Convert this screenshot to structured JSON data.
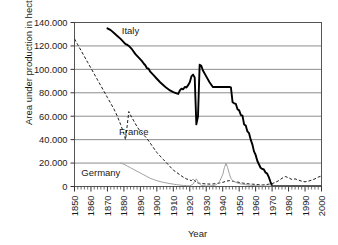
{
  "chart_data": {
    "type": "line",
    "title": "",
    "xlabel": "Year",
    "ylabel": "Area under production in hectares",
    "xlim": [
      1850,
      2000
    ],
    "ylim": [
      0,
      140000
    ],
    "grid": true,
    "legend": "inline-annotations",
    "ytick_labels": [
      "140.000",
      "120.000",
      "100.000",
      "80.000",
      "60.000",
      "40.000",
      "20.000",
      "0"
    ],
    "ytick_values": [
      140000,
      120000,
      100000,
      80000,
      60000,
      40000,
      20000,
      0
    ],
    "xtick_labels": [
      "1850",
      "1860",
      "1870",
      "1880",
      "1890",
      "1900",
      "1910",
      "1920",
      "1930",
      "1940",
      "1950",
      "1960",
      "1970",
      "1980",
      "1990",
      "2000"
    ],
    "xtick_values": [
      1850,
      1860,
      1870,
      1880,
      1890,
      1900,
      1910,
      1920,
      1930,
      1940,
      1950,
      1960,
      1970,
      1980,
      1990,
      2000
    ],
    "series": [
      {
        "name": "Italy",
        "style": "solid-thick-black",
        "color": "#000000",
        "label_position": {
          "x": 1884,
          "y": 133000
        },
        "points": [
          [
            1870,
            135000
          ],
          [
            1872,
            133500
          ],
          [
            1874,
            131000
          ],
          [
            1876,
            128500
          ],
          [
            1878,
            126000
          ],
          [
            1880,
            123000
          ],
          [
            1881,
            121500
          ],
          [
            1882,
            121000
          ],
          [
            1883,
            120000
          ],
          [
            1885,
            117000
          ],
          [
            1887,
            113000
          ],
          [
            1889,
            110000
          ],
          [
            1891,
            107000
          ],
          [
            1892,
            105000
          ],
          [
            1893,
            103500
          ],
          [
            1894,
            101000
          ],
          [
            1895,
            100500
          ],
          [
            1896,
            98000
          ],
          [
            1898,
            95000
          ],
          [
            1900,
            92000
          ],
          [
            1902,
            89000
          ],
          [
            1904,
            86500
          ],
          [
            1906,
            84000
          ],
          [
            1908,
            82000
          ],
          [
            1910,
            80500
          ],
          [
            1912,
            79500
          ],
          [
            1913,
            79000
          ],
          [
            1914,
            82000
          ],
          [
            1915,
            83500
          ],
          [
            1916,
            83000
          ],
          [
            1917,
            85000
          ],
          [
            1918,
            84500
          ],
          [
            1919,
            86500
          ],
          [
            1920,
            89000
          ],
          [
            1921,
            94000
          ],
          [
            1922,
            95500
          ],
          [
            1923,
            93000
          ],
          [
            1924,
            53000
          ],
          [
            1925,
            60000
          ],
          [
            1926,
            104000
          ],
          [
            1927,
            103000
          ],
          [
            1928,
            99000
          ],
          [
            1930,
            94000
          ],
          [
            1932,
            89000
          ],
          [
            1934,
            85000
          ],
          [
            1940,
            85000
          ],
          [
            1944,
            85000
          ],
          [
            1945,
            84500
          ],
          [
            1946,
            72000
          ],
          [
            1947,
            71000
          ],
          [
            1948,
            70500
          ],
          [
            1949,
            66000
          ],
          [
            1950,
            65000
          ],
          [
            1951,
            61000
          ],
          [
            1952,
            60500
          ],
          [
            1953,
            53000
          ],
          [
            1954,
            52000
          ],
          [
            1955,
            47000
          ],
          [
            1956,
            45500
          ],
          [
            1957,
            40000
          ],
          [
            1958,
            36000
          ],
          [
            1959,
            30000
          ],
          [
            1960,
            27000
          ],
          [
            1961,
            22000
          ],
          [
            1962,
            19000
          ],
          [
            1963,
            16000
          ],
          [
            1964,
            15000
          ],
          [
            1965,
            14500
          ],
          [
            1966,
            12000
          ],
          [
            1967,
            11000
          ],
          [
            1968,
            8000
          ],
          [
            1969,
            4000
          ],
          [
            1970,
            500
          ],
          [
            1972,
            300
          ],
          [
            1975,
            200
          ],
          [
            1980,
            200
          ],
          [
            1985,
            200
          ],
          [
            1990,
            200
          ],
          [
            1995,
            200
          ],
          [
            2000,
            200
          ]
        ]
      },
      {
        "name": "France",
        "style": "dashed-black",
        "color": "#1a1a1a",
        "label_position": {
          "x": 1886,
          "y": 47000
        },
        "points": [
          [
            1850,
            126000
          ],
          [
            1852,
            121000
          ],
          [
            1854,
            116000
          ],
          [
            1856,
            111000
          ],
          [
            1858,
            106000
          ],
          [
            1860,
            101000
          ],
          [
            1862,
            96000
          ],
          [
            1864,
            91000
          ],
          [
            1866,
            86000
          ],
          [
            1868,
            81000
          ],
          [
            1870,
            76000
          ],
          [
            1872,
            71000
          ],
          [
            1874,
            66000
          ],
          [
            1876,
            60000
          ],
          [
            1878,
            53000
          ],
          [
            1880,
            45000
          ],
          [
            1881,
            40000
          ],
          [
            1882,
            52000
          ],
          [
            1883,
            64000
          ],
          [
            1884,
            61000
          ],
          [
            1886,
            56000
          ],
          [
            1888,
            51000
          ],
          [
            1890,
            47000
          ],
          [
            1892,
            44000
          ],
          [
            1894,
            41000
          ],
          [
            1896,
            37000
          ],
          [
            1898,
            33000
          ],
          [
            1900,
            29000
          ],
          [
            1902,
            26000
          ],
          [
            1904,
            23000
          ],
          [
            1906,
            20000
          ],
          [
            1908,
            17000
          ],
          [
            1910,
            14000
          ],
          [
            1912,
            12000
          ],
          [
            1914,
            10000
          ],
          [
            1916,
            8000
          ],
          [
            1918,
            6500
          ],
          [
            1920,
            5500
          ],
          [
            1921,
            5000
          ],
          [
            1922,
            6500
          ],
          [
            1923,
            5000
          ],
          [
            1924,
            3500
          ],
          [
            1925,
            3000
          ],
          [
            1927,
            2500
          ],
          [
            1930,
            2200
          ],
          [
            1933,
            2000
          ],
          [
            1936,
            2500
          ],
          [
            1938,
            3000
          ],
          [
            1940,
            3500
          ],
          [
            1942,
            4500
          ],
          [
            1944,
            5000
          ],
          [
            1946,
            4500
          ],
          [
            1948,
            4000
          ],
          [
            1950,
            3500
          ],
          [
            1952,
            3000
          ],
          [
            1954,
            2500
          ],
          [
            1956,
            2200
          ],
          [
            1958,
            2000
          ],
          [
            1960,
            1800
          ],
          [
            1962,
            1500
          ],
          [
            1964,
            1300
          ],
          [
            1966,
            1500
          ],
          [
            1968,
            2000
          ],
          [
            1970,
            2500
          ],
          [
            1972,
            3500
          ],
          [
            1974,
            5000
          ],
          [
            1976,
            7000
          ],
          [
            1978,
            8500
          ],
          [
            1980,
            7500
          ],
          [
            1982,
            6000
          ],
          [
            1984,
            6500
          ],
          [
            1986,
            5500
          ],
          [
            1988,
            4500
          ],
          [
            1990,
            4000
          ],
          [
            1992,
            4500
          ],
          [
            1994,
            5500
          ],
          [
            1996,
            6500
          ],
          [
            1998,
            8000
          ],
          [
            2000,
            9000
          ]
        ]
      },
      {
        "name": "Germany",
        "style": "solid-thin-gray",
        "color": "#a0a0a0",
        "label_position": {
          "x": 1866,
          "y": 12000
        },
        "points": [
          [
            1878,
            20000
          ],
          [
            1880,
            19000
          ],
          [
            1882,
            17500
          ],
          [
            1884,
            16000
          ],
          [
            1886,
            14500
          ],
          [
            1888,
            13000
          ],
          [
            1890,
            11500
          ],
          [
            1892,
            10000
          ],
          [
            1894,
            8500
          ],
          [
            1896,
            7000
          ],
          [
            1898,
            6000
          ],
          [
            1900,
            5000
          ],
          [
            1902,
            4200
          ],
          [
            1904,
            3500
          ],
          [
            1906,
            3000
          ],
          [
            1908,
            2500
          ],
          [
            1910,
            2000
          ],
          [
            1912,
            1600
          ],
          [
            1914,
            1200
          ],
          [
            1916,
            900
          ],
          [
            1918,
            700
          ],
          [
            1920,
            600
          ],
          [
            1922,
            2000
          ],
          [
            1923,
            4500
          ],
          [
            1924,
            6500
          ],
          [
            1925,
            4000
          ],
          [
            1926,
            2000
          ],
          [
            1927,
            1000
          ],
          [
            1928,
            700
          ],
          [
            1930,
            500
          ],
          [
            1932,
            500
          ],
          [
            1934,
            700
          ],
          [
            1936,
            1500
          ],
          [
            1938,
            4000
          ],
          [
            1940,
            10000
          ],
          [
            1941,
            16000
          ],
          [
            1942,
            20000
          ],
          [
            1943,
            16000
          ],
          [
            1944,
            11000
          ],
          [
            1945,
            7000
          ],
          [
            1946,
            5000
          ],
          [
            1948,
            3500
          ],
          [
            1950,
            2500
          ],
          [
            1952,
            2000
          ],
          [
            1954,
            1500
          ],
          [
            1956,
            1200
          ],
          [
            1958,
            900
          ],
          [
            1960,
            700
          ],
          [
            1962,
            500
          ],
          [
            1965,
            400
          ],
          [
            1970,
            300
          ],
          [
            1975,
            250
          ],
          [
            1980,
            250
          ],
          [
            1985,
            250
          ],
          [
            1990,
            250
          ],
          [
            1995,
            250
          ],
          [
            2000,
            250
          ]
        ]
      }
    ]
  }
}
